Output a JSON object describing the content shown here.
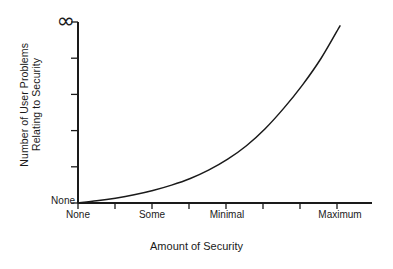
{
  "chart_data": {
    "type": "line",
    "title": "",
    "subtitle": "",
    "xlabel": "Amount of Security",
    "ylabel": "Number of User Problems Relating to Security",
    "ylabel_line1": "Number of User Problems",
    "ylabel_line2": "Relating to Security",
    "grid": false,
    "legend": false,
    "legend_position": "none",
    "line_color": "#1a1a1a",
    "axis_color": "#1a1a1a",
    "background_color": "#ffffff",
    "xlim": [
      0,
      8
    ],
    "ylim": [
      0,
      1
    ],
    "x_tick_positions": [
      0,
      1,
      2,
      3,
      4,
      5,
      6,
      7
    ],
    "x_tick_labels": [
      "None",
      "",
      "Some",
      "",
      "Minimal",
      "",
      "",
      "Maximum"
    ],
    "x_labeled_ticks": [
      {
        "position": 0,
        "label": "None"
      },
      {
        "position": 2,
        "label": "Some"
      },
      {
        "position": 4,
        "label": "Minimal"
      },
      {
        "position": 7,
        "label": "Maximum"
      }
    ],
    "y_tick_positions": [
      0.0,
      0.2,
      0.4,
      0.6,
      0.8,
      1.0
    ],
    "y_tick_labels": [
      "None",
      "",
      "",
      "",
      "",
      "∞"
    ],
    "y_labeled_ticks": [
      {
        "position": 1.0,
        "label": "∞"
      },
      {
        "position": 0.0,
        "label": "None"
      }
    ],
    "series": [
      {
        "name": "User problems vs. security",
        "x": [
          0.0,
          0.5,
          1.0,
          1.5,
          2.0,
          2.5,
          3.0,
          3.5,
          4.0,
          4.5,
          5.0,
          5.5,
          6.0,
          6.5,
          7.0
        ],
        "y": [
          0.0,
          0.012,
          0.027,
          0.046,
          0.07,
          0.1,
          0.137,
          0.185,
          0.245,
          0.32,
          0.415,
          0.53,
          0.66,
          0.81,
          0.99
        ]
      }
    ],
    "annotations": []
  },
  "axis": {
    "y_top_tick_label": "∞",
    "y_bottom_tick_label": "None",
    "x_title": "Amount of Security",
    "y_title_line1": "Number of User Problems",
    "y_title_line2": "Relating to Security"
  },
  "x_labels": {
    "none": "None",
    "some": "Some",
    "minimal": "Minimal",
    "maximum": "Maximum"
  }
}
